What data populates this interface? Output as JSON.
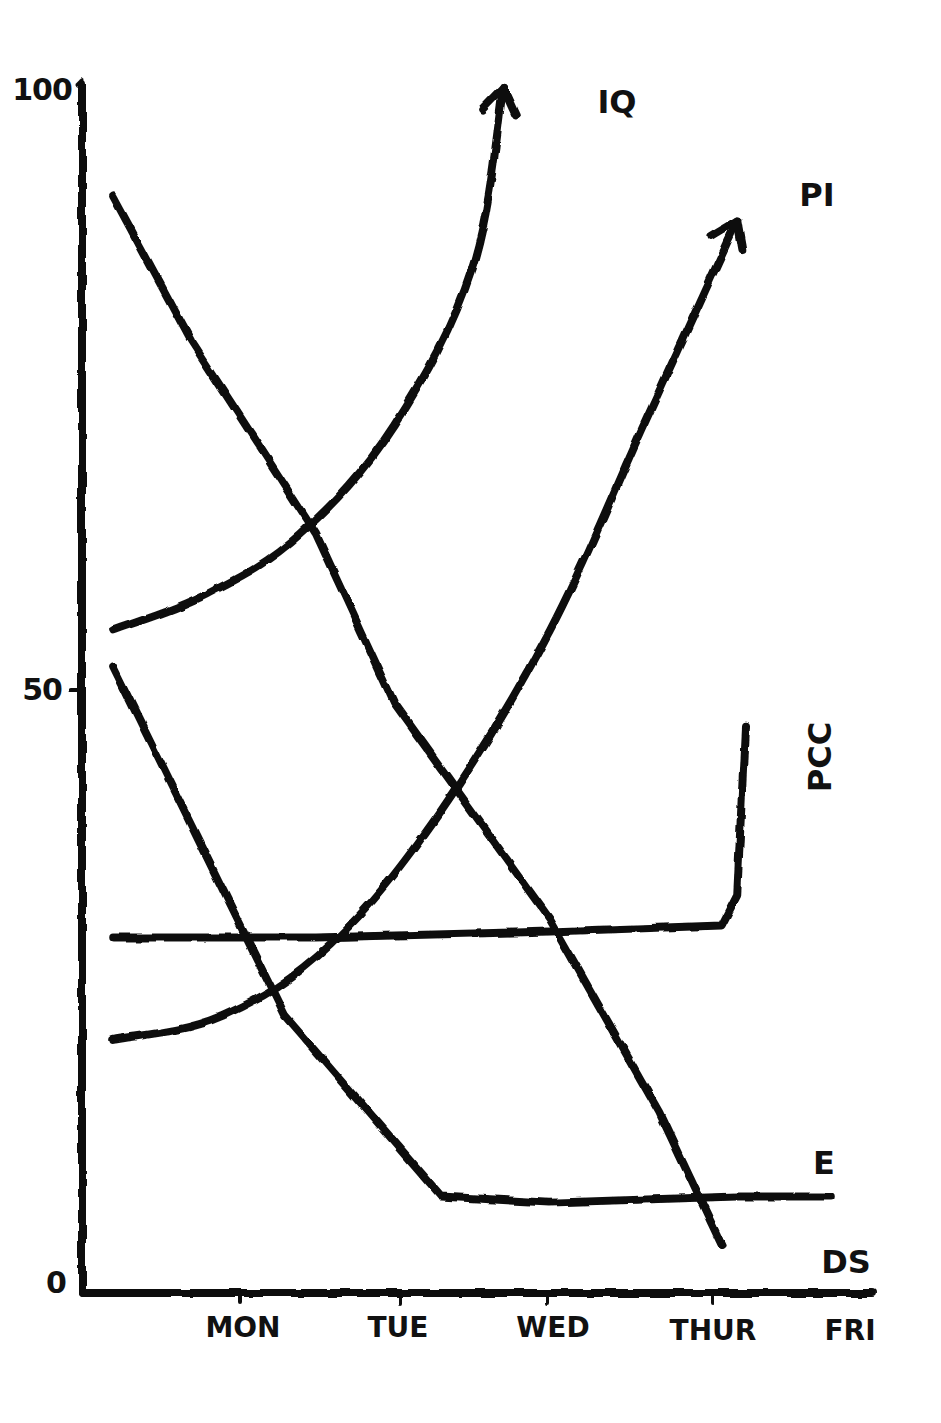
{
  "chart_data": {
    "type": "line",
    "title": "",
    "xlabel": "",
    "ylabel": "",
    "style": "hand-drawn, black ink on white",
    "grid": false,
    "legend_position": "inline labels at line ends",
    "ylim": [
      0,
      100
    ],
    "y_ticks": [
      {
        "value": 0,
        "label": "0"
      },
      {
        "value": 50,
        "label": "50"
      },
      {
        "value": 100,
        "label": "100"
      }
    ],
    "categories": [
      "MON",
      "TUE",
      "WED",
      "THUR",
      "FRI"
    ],
    "x_note": "x positions expressed in days: 0 = axis origin, 1 = MON, 2 = TUE, 3 = WED, 4 = THUR, 5 = FRI",
    "series": [
      {
        "name": "IQ",
        "arrow_end": true,
        "points": [
          [
            0.2,
            55
          ],
          [
            0.8,
            58
          ],
          [
            1.4,
            63
          ],
          [
            2.0,
            72
          ],
          [
            2.5,
            85
          ],
          [
            2.7,
            100
          ]
        ]
      },
      {
        "name": "PI",
        "arrow_end": true,
        "points": [
          [
            0.2,
            21
          ],
          [
            0.9,
            23
          ],
          [
            1.6,
            29
          ],
          [
            2.3,
            40
          ],
          [
            3.0,
            55
          ],
          [
            3.6,
            72
          ],
          [
            4.2,
            89
          ]
        ]
      },
      {
        "name": "PCC",
        "arrow_end": false,
        "points": [
          [
            0.2,
            29.5
          ],
          [
            1.5,
            29.5
          ],
          [
            3.0,
            30
          ],
          [
            4.1,
            30.5
          ],
          [
            4.2,
            33
          ],
          [
            4.25,
            47
          ]
        ]
      },
      {
        "name": "E",
        "arrow_end": false,
        "points": [
          [
            0.2,
            52
          ],
          [
            1.3,
            23
          ],
          [
            2.3,
            8
          ],
          [
            3.0,
            7.5
          ],
          [
            4.2,
            8
          ],
          [
            4.8,
            8
          ]
        ]
      },
      {
        "name": "DS",
        "arrow_end": false,
        "points": [
          [
            0.2,
            91
          ],
          [
            0.7,
            79
          ],
          [
            1.5,
            63
          ],
          [
            2.0,
            49
          ],
          [
            3.0,
            31
          ],
          [
            3.7,
            15
          ],
          [
            4.1,
            4
          ]
        ]
      }
    ]
  },
  "axes": {
    "y_labels": {
      "top": "100",
      "mid": "50",
      "zero": "0"
    },
    "x_labels": [
      "MON",
      "TUE",
      "WED",
      "THUR",
      "FRI"
    ]
  },
  "series_labels": {
    "iq": "IQ",
    "pi": "PI",
    "pcc": "PCC",
    "e": "E",
    "ds": "DS"
  },
  "colors": {
    "ink": "#111111",
    "background": "#ffffff"
  }
}
